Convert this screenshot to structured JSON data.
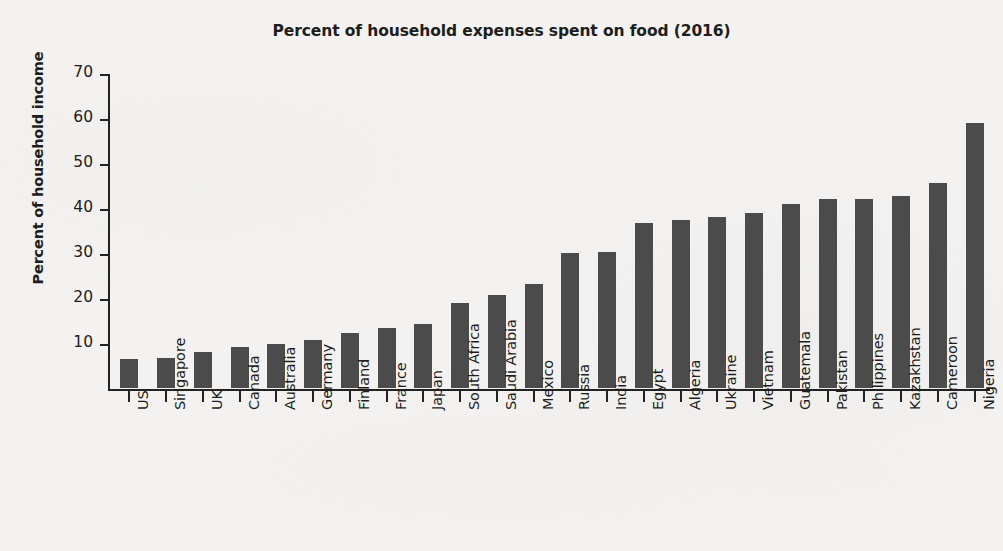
{
  "chart_data": {
    "type": "bar",
    "title": "Percent of household expenses spent on food (2016)",
    "xlabel": "",
    "ylabel": "Percent of household income",
    "ylim": [
      0,
      70
    ],
    "yticks": [
      10,
      20,
      30,
      40,
      50,
      60,
      70
    ],
    "grid": false,
    "legend": null,
    "bar_color": "#4b4b4b",
    "background_color": "#f3f2f0",
    "categories": [
      "US",
      "Singapore",
      "UK",
      "Canada",
      "Australia",
      "Germany",
      "Finland",
      "France",
      "Japan",
      "South Africa",
      "Saudi Arabia",
      "Mexico",
      "Russia",
      "India",
      "Egypt",
      "Algeria",
      "Ukraine",
      "Vietnam",
      "Guatemala",
      "Pakistan",
      "Philippines",
      "Kazakhstan",
      "Cameroon",
      "Nigeria"
    ],
    "values": [
      6.4,
      6.7,
      8.1,
      9.2,
      9.8,
      10.6,
      12.2,
      13.4,
      14.3,
      18.8,
      20.7,
      23.2,
      29.9,
      30.3,
      36.6,
      37.4,
      38.0,
      38.8,
      40.9,
      41.9,
      41.9,
      42.6,
      45.5,
      58.9
    ]
  }
}
